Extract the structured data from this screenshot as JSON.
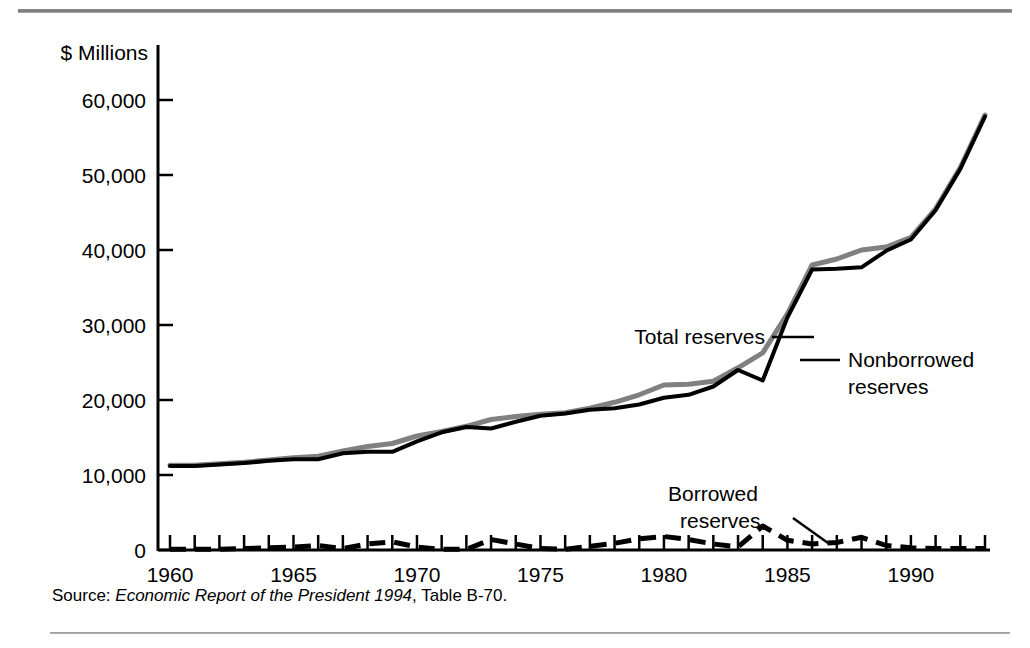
{
  "figure": {
    "y_axis_title": "$ Millions",
    "source_prefix": "Source:",
    "source_italic": "Economic Report of the President 1994",
    "source_suffix": ", Table B-70.",
    "colors": {
      "total_reserves": "#808080",
      "nonborrowed_reserves": "#000000",
      "borrowed_reserves": "#000000",
      "rule": "#8d8d8d",
      "background": "#ffffff"
    }
  },
  "annotations": [
    {
      "id": "total-reserves",
      "label": "Total reserves",
      "lines": [
        "Total reserves"
      ]
    },
    {
      "id": "nonborrowed-reserves",
      "label": "Nonborrowed reserves",
      "lines": [
        "Nonborrowed",
        "reserves"
      ]
    },
    {
      "id": "borrowed-reserves",
      "label": "Borrowed reserves",
      "lines": [
        "Borrowed",
        "reserves"
      ]
    }
  ],
  "chart_data": {
    "type": "line",
    "title": "",
    "subtitle": "",
    "xlabel": "",
    "ylabel": "$ Millions",
    "xlim": [
      1960,
      1993
    ],
    "ylim": [
      0,
      62000
    ],
    "grid": false,
    "legend": "annotations-inline",
    "y_ticks": [
      0,
      10000,
      20000,
      30000,
      40000,
      50000,
      60000
    ],
    "y_tick_labels": [
      "0",
      "10,000",
      "20,000",
      "30,000",
      "40,000",
      "50,000",
      "60,000"
    ],
    "x_ticks": [
      1960,
      1961,
      1962,
      1963,
      1964,
      1965,
      1966,
      1967,
      1968,
      1969,
      1970,
      1971,
      1972,
      1973,
      1974,
      1975,
      1976,
      1977,
      1978,
      1979,
      1980,
      1981,
      1982,
      1983,
      1984,
      1985,
      1986,
      1987,
      1988,
      1989,
      1990,
      1991,
      1992,
      1993
    ],
    "x_tick_labels_shown": [
      "1960",
      "1965",
      "1970",
      "1975",
      "1980",
      "1985",
      "1990"
    ],
    "x_labeled_ticks": [
      1960,
      1965,
      1970,
      1975,
      1980,
      1985,
      1990
    ],
    "x": [
      1960,
      1961,
      1962,
      1963,
      1964,
      1965,
      1966,
      1967,
      1968,
      1969,
      1970,
      1971,
      1972,
      1973,
      1974,
      1975,
      1976,
      1977,
      1978,
      1979,
      1980,
      1981,
      1982,
      1983,
      1984,
      1985,
      1986,
      1987,
      1988,
      1989,
      1990,
      1991,
      1992,
      1993
    ],
    "series": [
      {
        "name": "Total reserves",
        "style": "solid",
        "color": "#808080",
        "values": [
          11300,
          11300,
          11500,
          11700,
          12000,
          12300,
          12500,
          13200,
          13800,
          14200,
          15200,
          15800,
          16500,
          17400,
          17800,
          18100,
          18300,
          18900,
          19700,
          20700,
          22000,
          22100,
          22500,
          24300,
          26300,
          31500,
          38000,
          38800,
          40000,
          40400,
          41700,
          45500,
          51000,
          58000
        ]
      },
      {
        "name": "Nonborrowed reserves",
        "style": "solid",
        "color": "#000000",
        "values": [
          11200,
          11200,
          11400,
          11600,
          11900,
          12100,
          12100,
          12900,
          13100,
          13100,
          14500,
          15700,
          16400,
          16200,
          17100,
          17900,
          18200,
          18700,
          18900,
          19400,
          20300,
          20700,
          21800,
          24000,
          22600,
          31000,
          37400,
          37500,
          37700,
          39900,
          41400,
          45300,
          50800,
          57800
        ]
      },
      {
        "name": "Borrowed reserves",
        "style": "dashed",
        "color": "#000000",
        "values": [
          100,
          100,
          100,
          200,
          300,
          400,
          600,
          200,
          800,
          1100,
          400,
          100,
          100,
          1400,
          800,
          200,
          100,
          500,
          900,
          1500,
          1800,
          1400,
          800,
          400,
          3200,
          1300,
          800,
          1000,
          1700,
          600,
          300,
          200,
          200,
          200
        ]
      }
    ],
    "notes": {
      "units": "millions of dollars",
      "source": "Economic Report of the President 1994, Table B-70"
    }
  }
}
